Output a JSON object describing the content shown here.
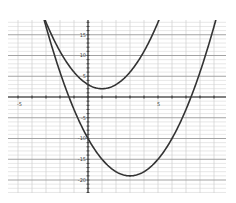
{
  "chart_data": {
    "type": "line",
    "title": "",
    "xlabel": "",
    "ylabel": "",
    "xlim": [
      -5.7,
      9.8
    ],
    "ylim": [
      -23,
      18
    ],
    "grid": true,
    "x_ticks": [
      {
        "value": -5,
        "label": "-5"
      },
      {
        "value": 5,
        "label": "5"
      }
    ],
    "y_ticks": [
      {
        "value": 15,
        "label": "15"
      },
      {
        "value": 10,
        "label": "10"
      },
      {
        "value": 5,
        "label": "5"
      },
      {
        "value": -5,
        "label": "-5"
      },
      {
        "value": -10,
        "label": "-10"
      },
      {
        "value": -15,
        "label": "-15"
      },
      {
        "value": -20,
        "label": "-20"
      }
    ],
    "series": [
      {
        "name": "upper parabola",
        "equation": "y = (x-1)^2 + 2",
        "vertex": [
          1,
          2
        ],
        "y_intercept": 3,
        "x": [
          -3.2,
          -3,
          -2,
          -1,
          0,
          1,
          2,
          3,
          4,
          5,
          5.1
        ],
        "y": [
          19.6,
          18,
          11,
          6,
          3,
          2,
          3,
          6,
          11,
          18,
          18.8
        ]
      },
      {
        "name": "lower parabola",
        "equation": "y = (x-3)^2 - 19",
        "vertex": [
          3,
          -19
        ],
        "y_intercept": -10,
        "roots": [
          -1.36,
          7.36
        ],
        "x": [
          -3.2,
          -3,
          -2,
          -1,
          0,
          1,
          2,
          3,
          4,
          5,
          6,
          7,
          8,
          9,
          9.2
        ],
        "y": [
          19.4,
          17,
          6,
          -3,
          -10,
          -15,
          -18,
          -19,
          -18,
          -15,
          -10,
          -3,
          6,
          17,
          19.4
        ]
      }
    ],
    "legend": null
  },
  "colors": {
    "curve": "#333333",
    "grid_minor": "#cfcfcf",
    "grid_major": "#999999",
    "axis": "#333333"
  }
}
